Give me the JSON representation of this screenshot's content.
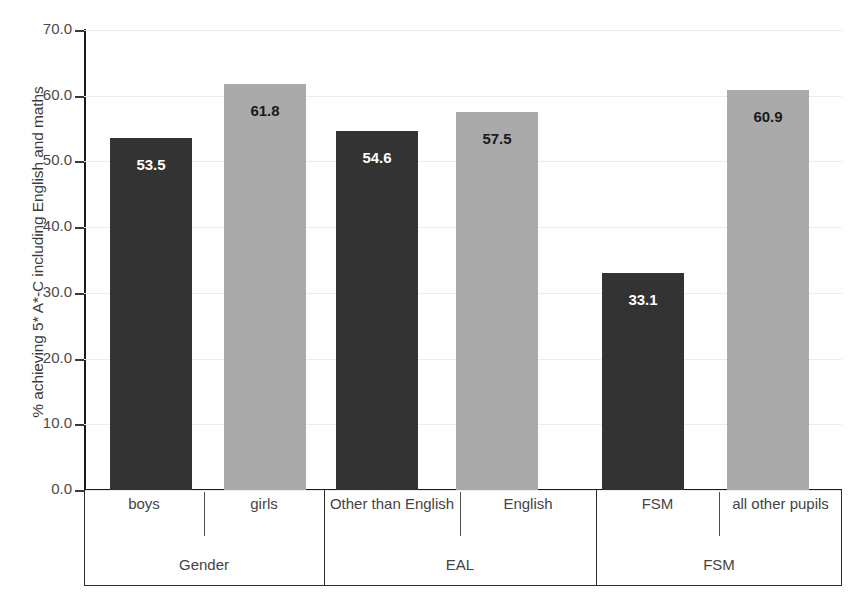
{
  "chart_data": {
    "type": "bar",
    "title": "",
    "subtitle": "",
    "xlabel": "",
    "ylabel": "% achieving 5* A*-C including English and maths",
    "ylim": [
      0,
      70
    ],
    "ytick_step": 10,
    "ytick_labels": [
      "70.0",
      "60.0",
      "50.0",
      "40.0",
      "30.0",
      "20.0",
      "10.0",
      "0.0"
    ],
    "ytick_values": [
      70,
      60,
      50,
      40,
      30,
      20,
      10,
      0
    ],
    "grid": true,
    "legend": "none",
    "categories": [
      "boys",
      "girls",
      "Other than English",
      "English",
      "FSM",
      "all other pupils"
    ],
    "values": [
      53.5,
      61.8,
      54.6,
      57.5,
      33.1,
      60.9
    ],
    "value_labels": [
      "53.5",
      "61.8",
      "54.6",
      "57.5",
      "33.1",
      "60.9"
    ],
    "bar_styles": [
      "dark",
      "light",
      "dark",
      "light",
      "dark",
      "light"
    ],
    "groups": [
      {
        "label": "Gender",
        "categories": [
          "boys",
          "girls"
        ]
      },
      {
        "label": "EAL",
        "categories": [
          "Other than English",
          "English"
        ]
      },
      {
        "label": "FSM",
        "categories": [
          "FSM",
          "all other pupils"
        ]
      }
    ],
    "colors": {
      "dark_bar": "#333333",
      "light_bar": "#aaaaaa",
      "axis": "#1a1a1a",
      "gridline": "#ececec",
      "tick_text": "#4a4a4a",
      "label_text": "#444444",
      "background": "#ffffff"
    }
  },
  "axis": {
    "ticks": [
      {
        "label": "70.0"
      },
      {
        "label": "60.0"
      },
      {
        "label": "50.0"
      },
      {
        "label": "40.0"
      },
      {
        "label": "30.0"
      },
      {
        "label": "20.0"
      },
      {
        "label": "10.0"
      },
      {
        "label": "0.0"
      }
    ],
    "y_title": "% achieving 5* A*-C including English and maths"
  },
  "bars": [
    {
      "label": "boys",
      "value_label": "53.5"
    },
    {
      "label": "girls",
      "value_label": "61.8"
    },
    {
      "label": "Other than English",
      "value_label": "54.6"
    },
    {
      "label": "English",
      "value_label": "57.5"
    },
    {
      "label": "FSM",
      "value_label": "33.1"
    },
    {
      "label": "all other pupils",
      "value_label": "60.9"
    }
  ],
  "groups": [
    {
      "label": "Gender"
    },
    {
      "label": "EAL"
    },
    {
      "label": "FSM"
    }
  ]
}
